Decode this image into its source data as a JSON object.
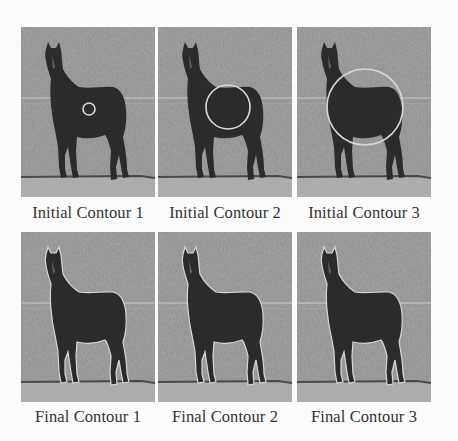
{
  "figure": {
    "rows": [
      {
        "name": "initial-contours",
        "panels": [
          {
            "caption": "Initial Contour 1",
            "contour": {
              "type": "circle",
              "cx": 68,
              "cy": 82,
              "r": 6
            }
          },
          {
            "caption": "Initial Contour 2",
            "contour": {
              "type": "circle",
              "cx": 70,
              "cy": 80,
              "r": 22
            }
          },
          {
            "caption": "Initial Contour 3",
            "contour": {
              "type": "circle",
              "cx": 68,
              "cy": 80,
              "r": 38
            }
          }
        ]
      },
      {
        "name": "final-contours",
        "panels": [
          {
            "caption": "Final Contour 1",
            "contour": {
              "type": "outline"
            }
          },
          {
            "caption": "Final Contour 2",
            "contour": {
              "type": "outline"
            }
          },
          {
            "caption": "Final Contour 3",
            "contour": {
              "type": "outline"
            }
          }
        ]
      }
    ],
    "colors": {
      "background": "#fbfbfb",
      "field": "#8c8c8c",
      "horse": "#2b2b2b",
      "contour": "#d8d8d8",
      "caption": "#333333"
    }
  }
}
